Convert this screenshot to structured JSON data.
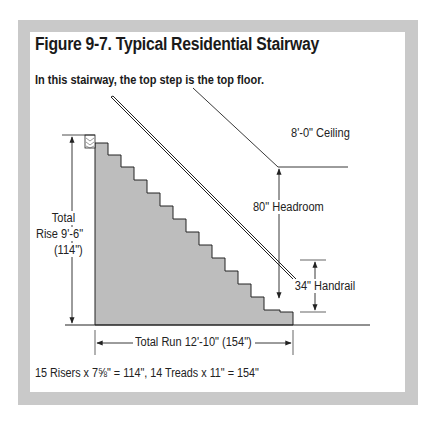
{
  "figure": {
    "title": "Figure 9-7. Typical Residential Stairway",
    "subtitle": "In this stairway, the top step is the top floor.",
    "labels": {
      "ceiling": "8'-0\" Ceiling",
      "headroom": "80\" Headroom",
      "handrail": "34\" Handrail",
      "total_rise_line1": "Total",
      "total_rise_line2": "Rise 9'-6\"",
      "total_rise_line3": "(114\")",
      "total_run": "Total Run 12'-10\" (154\")"
    },
    "formula": "15 Risers x 7⅝\" = 114\", 14 Treads x 11\" = 154\""
  },
  "dimensions": {
    "risers": 15,
    "riser_height_in": "7⅝",
    "treads": 14,
    "tread_depth_in": 11,
    "total_rise_in": 114,
    "total_run_in": 154,
    "ceiling_height": "8'-0\"",
    "headroom_in": 80,
    "handrail_in": 34
  },
  "colors": {
    "frame": "#c9c9c9",
    "stair_fill": "#bdbdbd",
    "line": "#222222"
  }
}
